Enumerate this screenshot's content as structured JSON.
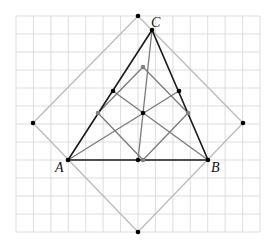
{
  "figure": {
    "width": 274,
    "height": 241,
    "background": "#ffffff"
  },
  "grid": {
    "x_lines": [
      16,
      33.4,
      50.9,
      68.3,
      85.7,
      103.1,
      120.6,
      138,
      155.4,
      172.9,
      190.3,
      207.7,
      225.1,
      242.6,
      260
    ],
    "y_lines": [
      16,
      34,
      52,
      70,
      88,
      106,
      124,
      142,
      160,
      178,
      196,
      214,
      232
    ],
    "x_min": 16,
    "x_max": 260,
    "y_min": 16,
    "y_max": 232,
    "color": "#d4d4d4",
    "stroke_width": 0.8
  },
  "outer_square": {
    "vertices": [
      [
        138,
        16
      ],
      [
        243,
        123
      ],
      [
        138,
        232
      ],
      [
        33,
        123
      ]
    ],
    "color": "#bdbdbd",
    "stroke_width": 1.4
  },
  "triangle": {
    "vertices": {
      "A": [
        68,
        160
      ],
      "B": [
        208,
        160
      ],
      "C": [
        152,
        30
      ]
    },
    "color": "#1a1a1a",
    "stroke_width": 1.6
  },
  "inner_lines": {
    "color": "#7a7a7a",
    "stroke_width": 1.3,
    "segments": [
      [
        [
          152,
          30
        ],
        [
          138,
          160
        ]
      ],
      [
        [
          68,
          160
        ],
        [
          179,
          91
        ]
      ],
      [
        [
          208,
          160
        ],
        [
          113,
          91
        ]
      ],
      [
        [
          143,
          67
        ],
        [
          98,
          113
        ]
      ],
      [
        [
          98,
          113
        ],
        [
          143,
          160
        ]
      ],
      [
        [
          143,
          160
        ],
        [
          188,
          113
        ]
      ],
      [
        [
          188,
          113
        ],
        [
          143,
          67
        ]
      ]
    ]
  },
  "points": {
    "black": [
      [
        138,
        16
      ],
      [
        243,
        123
      ],
      [
        138,
        232
      ],
      [
        33,
        123
      ],
      [
        68,
        160
      ],
      [
        208,
        160
      ],
      [
        152,
        30
      ],
      [
        113,
        91
      ],
      [
        179,
        91
      ],
      [
        143,
        113
      ],
      [
        138,
        160
      ]
    ],
    "gray": [
      [
        143,
        67
      ],
      [
        98,
        113
      ],
      [
        188,
        113
      ],
      [
        143,
        160
      ]
    ],
    "black_color": "#000000",
    "gray_color": "#808080",
    "radius": 2.3
  },
  "labels": [
    {
      "text": "A",
      "x": 55,
      "y": 172
    },
    {
      "text": "B",
      "x": 211,
      "y": 172
    },
    {
      "text": "C",
      "x": 151,
      "y": 27
    }
  ]
}
